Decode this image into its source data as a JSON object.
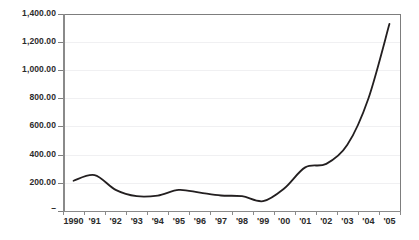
{
  "chart_data": {
    "type": "line",
    "title": "",
    "xlabel": "",
    "ylabel": "",
    "categories": [
      "1990",
      "'91",
      "'92",
      "'93",
      "'94",
      "'95",
      "'96",
      "'97",
      "'98",
      "'99",
      "'00",
      "'01",
      "'02",
      "'03",
      "'04",
      "'05"
    ],
    "x": [
      1990,
      1991,
      1992,
      1993,
      1994,
      1995,
      1996,
      1997,
      1998,
      1999,
      2000,
      2001,
      2002,
      2003,
      2004,
      2005
    ],
    "values": [
      215,
      255,
      150,
      105,
      110,
      150,
      130,
      110,
      105,
      70,
      160,
      310,
      335,
      470,
      800,
      1330
    ],
    "series": [
      {
        "name": "",
        "values": [
          215,
          255,
          150,
          105,
          110,
          150,
          130,
          110,
          105,
          70,
          160,
          310,
          335,
          470,
          800,
          1330
        ]
      }
    ],
    "ylim": [
      0,
      1400
    ],
    "yticks": [
      0,
      200,
      400,
      600,
      800,
      1000,
      1200,
      1400
    ],
    "ytick_labels": [
      "–",
      "200.00",
      "400.00",
      "600.00",
      "800.00",
      "1,000.00",
      "1,200.00",
      "1,400.00"
    ],
    "grid": true,
    "legend": false,
    "legend_position": "none",
    "line_color": "#231f20",
    "background_color": "#ffffff",
    "gridline_color": "#f0f0f2",
    "axis_color": "#8a8a8a",
    "text_color": "#2b2b2b"
  }
}
